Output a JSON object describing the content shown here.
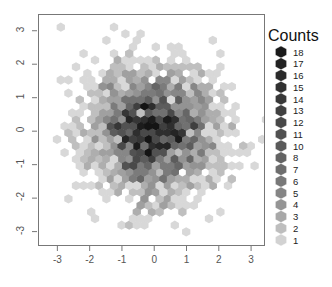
{
  "chart_data": {
    "type": "heatmap",
    "subtype": "hexbin",
    "title": "",
    "xlabel": "",
    "ylabel": "",
    "xlim": [
      -3.6,
      3.4
    ],
    "ylim": [
      -3.4,
      3.5
    ],
    "xticks": [
      "-3",
      "-2",
      "-1",
      "0",
      "1",
      "2",
      "3"
    ],
    "xtick_values": [
      -3,
      -2,
      -1,
      0,
      1,
      2,
      3
    ],
    "yticks": [
      "3",
      "2",
      "1",
      "0",
      "-1",
      "-2",
      "-3"
    ],
    "ytick_values": [
      3,
      2,
      1,
      0,
      -1,
      -2,
      -3
    ],
    "grid": false,
    "frame": true,
    "legend": {
      "title": "Counts",
      "position": "right",
      "labels": [
        "18",
        "17",
        "16",
        "15",
        "14",
        "13",
        "12",
        "11",
        "10",
        "8",
        "7",
        "6",
        "5",
        "4",
        "3",
        "2",
        "1"
      ],
      "values": [
        18,
        17,
        16,
        15,
        14,
        13,
        12,
        11,
        10,
        8,
        7,
        6,
        5,
        4,
        3,
        2,
        1
      ],
      "colors": [
        "#1a1a1a",
        "#222222",
        "#2a2a2a",
        "#303030",
        "#383838",
        "#404040",
        "#484848",
        "#515151",
        "#5a5a5a",
        "#636363",
        "#6d6d6d",
        "#787878",
        "#858585",
        "#959595",
        "#a8a8a8",
        "#bebebe",
        "#d2d2d2"
      ]
    },
    "colormap": {
      "low": "#d8d8d8",
      "high": "#141414",
      "count_min": 1,
      "count_max": 18
    },
    "distribution": {
      "kind": "bivariate-normal",
      "n_points": 2000,
      "mean_x": 0,
      "mean_y": 0,
      "sd_x": 1,
      "sd_y": 1,
      "correlation": 0
    },
    "hexbin": {
      "xbins": 36,
      "hex_width_px": 7.6,
      "hex_height_px": 8.8
    }
  },
  "plot_area": {
    "left_px": 38,
    "top_px": 14,
    "right_px": 264,
    "bottom_px": 245,
    "frame_color": "#777777",
    "background": "#ffffff"
  },
  "legend_geometry": {
    "hex_center_x_px": 281,
    "hex_top_y_px": 52,
    "hex_step_y_px": 11.75,
    "hex_radius_px": 5.6,
    "label_x_px": 293
  }
}
